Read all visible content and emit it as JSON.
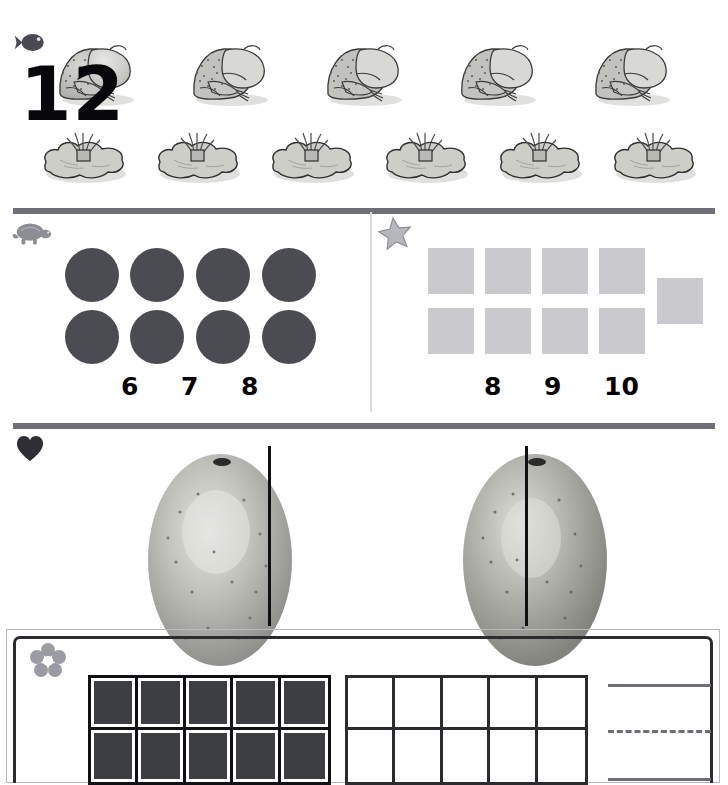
{
  "worksheet": {
    "title": "Kindergarten counting worksheet",
    "background": "#ffffff"
  },
  "sections": [
    {
      "id": "frogs",
      "icon": "fish-icon",
      "icon_color": "#4a4a55",
      "label": "Frogs and lily pads counting row",
      "rows": [
        {
          "name": "frog-row",
          "item": "frog",
          "count": 5
        },
        {
          "name": "lilypad-row",
          "item": "lilypad",
          "count": 6
        }
      ]
    },
    {
      "id": "counting",
      "panels": [
        {
          "id": "circles",
          "icon": "turtle-icon",
          "icon_color": "#8d8d95",
          "item": "circle",
          "item_color": "#4b4b52",
          "count": 8,
          "grid": {
            "cols": 4,
            "rows": 2
          },
          "choices": [
            "6",
            "7",
            "8"
          ]
        },
        {
          "id": "squares",
          "icon": "star-icon",
          "icon_color": "#a6a6ae",
          "item": "square",
          "item_color": "#c9c9ce",
          "count": 9,
          "grid": {
            "cols": 4,
            "rows": 2,
            "extra": 1
          },
          "choices": [
            "8",
            "9",
            "10"
          ]
        }
      ]
    },
    {
      "id": "fruit",
      "icon": "heart-icon",
      "icon_color": "#2e2e34",
      "label": "Fruit halves with cut lines",
      "items": [
        {
          "name": "fruit-left",
          "cut": "off-center"
        },
        {
          "name": "fruit-right",
          "cut": "center"
        }
      ]
    },
    {
      "id": "tenframe",
      "icon": "flower-icon",
      "icon_color": "#9b9ba3",
      "number": "12",
      "frames": [
        {
          "name": "filled-ten-frame",
          "cells": 10,
          "filled": 10,
          "fill_color": "#3d3d44"
        },
        {
          "name": "empty-ten-frame",
          "cells": 10,
          "filled": 0,
          "fill_color": "#ffffff"
        }
      ],
      "writing_lines": [
        "solid",
        "dashed",
        "solid"
      ]
    }
  ],
  "colors": {
    "divider": "#6f6f77",
    "vertical_divider": "#d9d9de",
    "ink": "#000000",
    "frame_border": "#2b2b30"
  }
}
